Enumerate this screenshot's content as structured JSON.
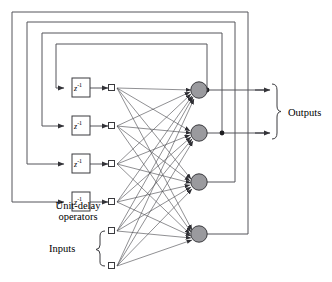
{
  "figure": {
    "type": "diagram",
    "labels": {
      "unit_delay": "Unit-delay\noperators",
      "unit_delay_line1": "Unit-delay",
      "unit_delay_line2": "operators",
      "inputs": "Inputs",
      "outputs": "Outputs"
    },
    "colors": {
      "line": "#55555a",
      "line_dark": "#333338",
      "neuron_fill": "#9a9a9e",
      "neuron_stroke": "#3a3a3e",
      "node_fill": "#ffffff",
      "node_stroke": "#3a3a3e",
      "text": "#000000",
      "background": "#ffffff"
    },
    "delay_blocks": [
      {
        "id": "delay-1",
        "label_base": "z",
        "label_exp": "-1",
        "x": 72,
        "y": 78
      },
      {
        "id": "delay-2",
        "label_base": "z",
        "label_exp": "-1",
        "x": 72,
        "y": 116
      },
      {
        "id": "delay-3",
        "label_base": "z",
        "label_exp": "-1",
        "x": 72,
        "y": 154
      },
      {
        "id": "delay-4",
        "label_base": "z",
        "label_exp": "-1",
        "x": 72,
        "y": 192
      }
    ],
    "input_nodes": [
      {
        "id": "node-1",
        "x": 112,
        "y": 88,
        "source": "delay-1"
      },
      {
        "id": "node-2",
        "x": 112,
        "y": 126,
        "source": "delay-2"
      },
      {
        "id": "node-3",
        "x": 112,
        "y": 164,
        "source": "delay-3"
      },
      {
        "id": "node-4",
        "x": 112,
        "y": 202,
        "source": "delay-4"
      },
      {
        "id": "node-5",
        "x": 112,
        "y": 231,
        "source": "input"
      },
      {
        "id": "node-6",
        "x": 112,
        "y": 266,
        "source": "input"
      }
    ],
    "neurons": [
      {
        "id": "neuron-1",
        "x": 199,
        "y": 90,
        "has_output": true,
        "junction_x": 207
      },
      {
        "id": "neuron-2",
        "x": 199,
        "y": 133,
        "has_output": true,
        "junction_x": 222
      },
      {
        "id": "neuron-3",
        "x": 199,
        "y": 182,
        "has_output": false,
        "junction_x": 235
      },
      {
        "id": "neuron-4",
        "x": 199,
        "y": 234,
        "has_output": false,
        "junction_x": 248
      }
    ],
    "feedback_loops": [
      {
        "id": "loop-1",
        "from_neuron": "neuron-1",
        "to_delay": "delay-1",
        "right_x": 207,
        "top_y": 44,
        "left_x": 56
      },
      {
        "id": "loop-2",
        "from_neuron": "neuron-2",
        "to_delay": "delay-2",
        "right_x": 222,
        "top_y": 33,
        "left_x": 42
      },
      {
        "id": "loop-3",
        "from_neuron": "neuron-3",
        "to_delay": "delay-3",
        "right_x": 235,
        "top_y": 22,
        "left_x": 27
      },
      {
        "id": "loop-4",
        "from_neuron": "neuron-4",
        "to_delay": "delay-4",
        "right_x": 248,
        "top_y": 12,
        "left_x": 12
      }
    ],
    "output_arrows": [
      {
        "id": "output-arrow-1",
        "y": 90
      },
      {
        "id": "output-arrow-2",
        "y": 133
      }
    ],
    "braces": [
      {
        "id": "brace-outputs",
        "orientation": "right",
        "x": 277,
        "y_top": 84,
        "y_bottom": 139
      },
      {
        "id": "brace-inputs",
        "orientation": "right",
        "x": 100,
        "y_top": 231,
        "y_bottom": 266
      }
    ]
  }
}
